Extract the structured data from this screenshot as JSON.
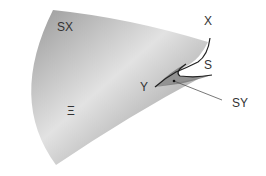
{
  "diagram": {
    "labels": {
      "sx": "SX",
      "x": "X",
      "s": "S",
      "y": "Y",
      "sy": "SY",
      "xi": "Ξ"
    }
  }
}
